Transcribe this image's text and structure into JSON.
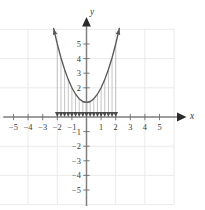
{
  "chart_data": {
    "type": "line",
    "title": "",
    "subtitle": "",
    "xlabel": "x",
    "ylabel": "y",
    "xlim": [
      -6.2,
      6.2
    ],
    "ylim": [
      -6.2,
      6.2
    ],
    "grid": true,
    "grid_step": 2,
    "grid_color": "#e8e8e8",
    "axis_color": "#808080",
    "curve_color": "#5a5a5a",
    "arrow_color": "#4a4a4a",
    "legend": "none",
    "xticks": [
      -5,
      -4,
      -3,
      -2,
      -1,
      1,
      2,
      3,
      4,
      5
    ],
    "xtick_labels": [
      "-5",
      "-4",
      "-3",
      "-2",
      "-1",
      "1",
      "2",
      "3",
      "4",
      "5"
    ],
    "yticks": [
      5,
      4,
      3,
      2,
      1,
      -1,
      -2,
      -3,
      -4,
      -5
    ],
    "ytick_labels": [
      "5",
      "4",
      "3",
      "2",
      "1",
      "-1",
      "-2",
      "-3",
      "-4",
      "-5"
    ],
    "visible_ytick_labels": [
      "5",
      "4",
      "3",
      "2",
      "-1",
      "-2",
      "-3",
      "-4",
      "-5"
    ],
    "series": [
      {
        "name": "parabola",
        "equation": "y = x^2 + 1",
        "vertex": [
          0,
          1
        ],
        "x": [
          -2.25,
          -2.0,
          -1.75,
          -1.5,
          -1.25,
          -1.0,
          -0.75,
          -0.5,
          -0.25,
          0,
          0.25,
          0.5,
          0.75,
          1.0,
          1.25,
          1.5,
          1.75,
          2.0,
          2.25
        ],
        "y": [
          6.06,
          5.0,
          4.06,
          3.25,
          2.56,
          2.0,
          1.56,
          1.25,
          1.06,
          1.0,
          1.06,
          1.25,
          1.56,
          2.0,
          2.56,
          3.25,
          4.06,
          5.0,
          6.06
        ],
        "arrow_start": true,
        "arrow_end": true
      }
    ],
    "annotations": {
      "shading_type": "downward-arrows",
      "description": "Vertical arrows drawn from the curve down to the x-axis",
      "arrow_x_positions": [
        -2.0,
        -1.75,
        -1.5,
        -1.25,
        -1.0,
        -0.75,
        -0.5,
        -0.25,
        0,
        0.25,
        0.5,
        0.75,
        1.0,
        1.25,
        1.5,
        1.75,
        2.0
      ],
      "arrow_direction": "down",
      "arrow_tip_y": 0
    }
  },
  "axes": {
    "x_axis_label": "x",
    "y_axis_label": "y",
    "x_axis_arrow": true,
    "y_axis_arrow": true
  }
}
